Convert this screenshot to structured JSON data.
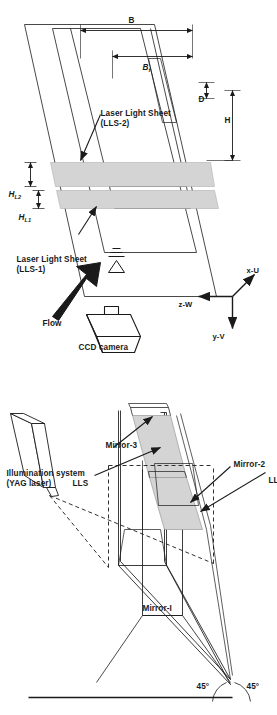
{
  "figure": {
    "orientation": "rotated-90-ccw",
    "background_color": "#ffffff",
    "line_color": "#1a1a1a",
    "sheet_fill_color": "#d4d4d4",
    "panels": [
      {
        "id": "panel-mirror-system",
        "description": "Perspective sketch of three-mirror periscope arrangement illuminated by a YAG laser, forming two laser light sheets"
      },
      {
        "id": "panel-flume-setup",
        "description": "Perspective sketch of open channel flume with CCD camera, flow direction and two vertical laser light sheets with geometric dimensions"
      }
    ]
  },
  "panel_top": {
    "illumination_label_line1": "Illumination system",
    "illumination_label_line2": "(YAG laser)",
    "lls_upper": "LLS",
    "lls_lower": "LLS",
    "mirror_1": "Mirror-I",
    "mirror_2": "Mirror-2",
    "mirror_3": "Mirror-3",
    "angle_left": "45°",
    "angle_right": "45°"
  },
  "panel_bottom": {
    "ccd_camera": "CCD camera",
    "flow": "Flow",
    "lls1_line1": "Laser Light Sheet",
    "lls1_line2": "(LLS-1)",
    "lls2_line1": "Laser Light Sheet",
    "lls2_line2": "(LLS-2)",
    "dim_H_L1_main": "H",
    "dim_H_L1_sub": "L1",
    "dim_H_L2_main": "H",
    "dim_H_L2_sub": "L2",
    "dim_B": "B",
    "dim_Bf_main": "B",
    "dim_Bf_sub": "f",
    "dim_D": "D",
    "dim_H": "H",
    "axis_x": "x-U",
    "axis_y": "y-V",
    "axis_z": "z-W"
  }
}
